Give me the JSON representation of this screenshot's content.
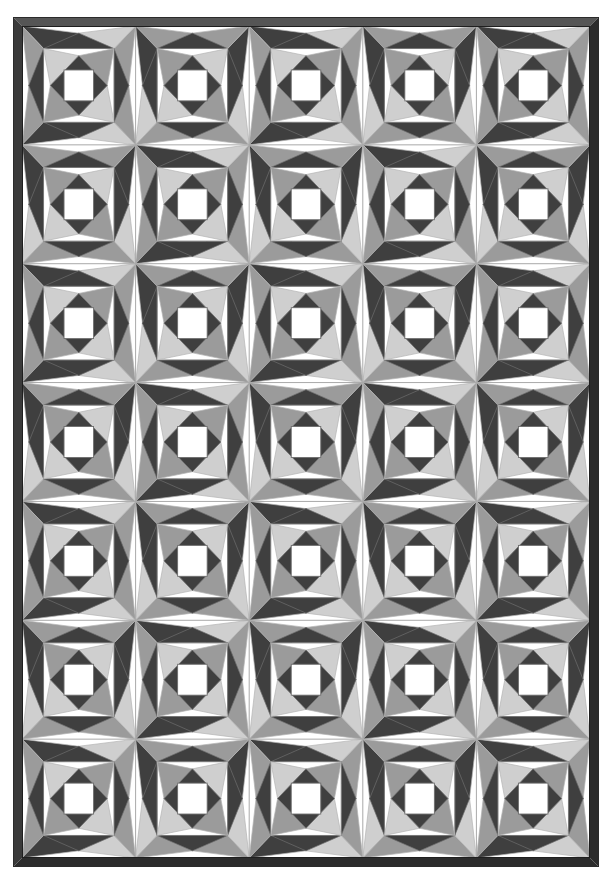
{
  "artwork": {
    "title": "Pineapple / Storm-at-Sea patchwork quilt",
    "kind": "quilt-pattern",
    "canvas": {
      "width": 612,
      "height": 884
    },
    "background_color": "#ffffff"
  },
  "frame": {
    "name": "quilt-border",
    "x": 13,
    "y": 17,
    "width": 586,
    "height": 850,
    "thickness": 9,
    "color": "#3a3a3a",
    "highlight_color": "#555555",
    "shadow_color": "#2c2c2c"
  },
  "field": {
    "x": 22,
    "y": 26,
    "width": 568,
    "height": 832,
    "columns": 5,
    "rows": 7,
    "cell_width": 113.6,
    "cell_height": 118.857,
    "grid_line_color": "#a9a9a9",
    "grid_line_width": 1
  },
  "palette": {
    "dark": "#3f3f3f",
    "medium": "#9b9b9b",
    "light": "#cfcfcf",
    "pale": "#e6e6e6",
    "white": "#ffffff",
    "outline": "#6e6e6e",
    "outline_light": "#b5b5b5"
  },
  "block": {
    "name": "pineapple-block",
    "rings": [
      {
        "index": 0,
        "label": "outer-corner-triangles",
        "colors": [
          "dark",
          "medium",
          "light",
          "white"
        ]
      },
      {
        "index": 1,
        "label": "outer-diamond-ring",
        "colors": [
          "white",
          "dark"
        ]
      },
      {
        "index": 2,
        "label": "mid-square-frame",
        "colors": [
          "white",
          "medium"
        ]
      },
      {
        "index": 3,
        "label": "inner-diamond-ring",
        "colors": [
          "dark",
          "light"
        ]
      },
      {
        "index": 4,
        "label": "center-square",
        "colors": [
          "white"
        ]
      }
    ],
    "center_square_ratio": 0.26,
    "inner_diamond_ratio": 0.5,
    "mid_square_ratio": 0.62,
    "outer_diamond_ratio": 0.88
  },
  "labels": {
    "root": "quilt-artwork",
    "canvas": "quilt-canvas",
    "border": "quilt-border-frame",
    "field": "quilt-block-field",
    "grid": "quilt-grid-lines",
    "block": "quilt-block"
  }
}
